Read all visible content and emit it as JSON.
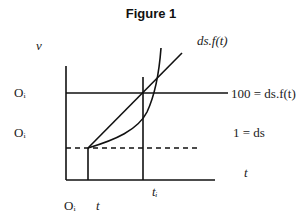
{
  "figure": {
    "title": "Figure 1",
    "labels": {
      "y_axis": "v",
      "o_upper": "Oᵢ",
      "o_lower": "Oᵢ",
      "curve_label": "ds.f(t)",
      "upper_line_label": "100 = ds.f(t)",
      "dashed_line_label": "1 = ds",
      "x_axis": "t",
      "t1_tick": "tᵢ",
      "origin": "Oᵢ",
      "t_tick": "t"
    },
    "colors": {
      "line": "#111111",
      "background": "#ffffff"
    }
  }
}
